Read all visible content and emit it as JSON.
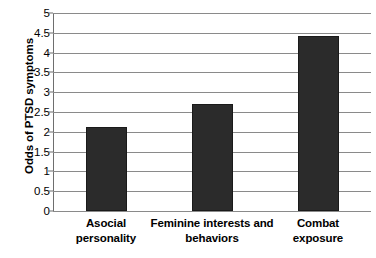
{
  "chart_data": {
    "type": "bar",
    "title": "",
    "subtitle": "",
    "xlabel": "",
    "ylabel": "Odds of PTSD symptoms",
    "categories": [
      "Asocial personality",
      "Feminine interests and behaviors",
      "Combat exposure"
    ],
    "category_lines": [
      [
        "Asocial",
        "personality"
      ],
      [
        "Feminine interests and",
        "behaviors"
      ],
      [
        "Combat",
        "exposure"
      ]
    ],
    "values": [
      2.13,
      2.69,
      4.42
    ],
    "ylim": [
      0,
      5
    ],
    "ytick_step": 0.5,
    "ytick_labels": [
      "5",
      "4.5",
      "4",
      "3.5",
      "3",
      "2.5",
      "2",
      "1.5",
      "1",
      "0.5",
      "0"
    ],
    "ytick_values": [
      5,
      4.5,
      4,
      3.5,
      3,
      2.5,
      2,
      1.5,
      1,
      0.5,
      0
    ],
    "grid": true,
    "grid_orientation": "horizontal",
    "legend": false,
    "legend_position": "none",
    "colors": {
      "bar_fill": "#2b2b2b",
      "bar_edge": "#1a1a1a",
      "gridline": "#8a8a8a",
      "axis": "#6e6e6e",
      "text": "#000000",
      "background": "#ffffff"
    }
  }
}
